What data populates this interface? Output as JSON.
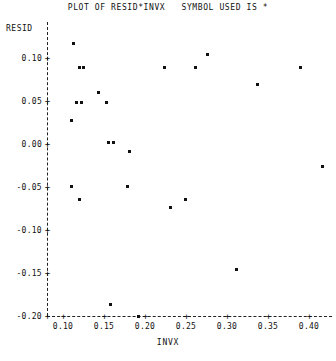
{
  "header": {
    "title": "PLOT OF RESID*INVX",
    "symbol_note": "SYMBOL USED IS *",
    "title_full": "PLOT OF RESID*INVX   SYMBOL USED IS *"
  },
  "chart_data": {
    "type": "scatter",
    "title": "PLOT OF RESID*INVX   SYMBOL USED IS *",
    "xlabel": "INVX",
    "ylabel": "RESID",
    "symbol": "*",
    "grid": false,
    "legend": "none",
    "xlim": [
      0.085,
      0.425
    ],
    "ylim": [
      -0.215,
      0.125
    ],
    "xticks": [
      0.1,
      0.15,
      0.2,
      0.25,
      0.3,
      0.35,
      0.4
    ],
    "xtick_labels": [
      "0.10",
      "0.15",
      "0.20",
      "0.25",
      "0.30",
      "0.35",
      "0.40"
    ],
    "yticks": [
      0.1,
      0.05,
      0.0,
      -0.05,
      -0.1,
      -0.15,
      -0.2
    ],
    "ytick_labels": [
      "0.10",
      "0.05",
      "0.00",
      "-0.05",
      "-0.10",
      "-0.15",
      "-0.20"
    ],
    "points": [
      {
        "x": 0.112,
        "y": 0.118
      },
      {
        "x": 0.276,
        "y": 0.105
      },
      {
        "x": 0.12,
        "y": 0.09
      },
      {
        "x": 0.124,
        "y": 0.09
      },
      {
        "x": 0.223,
        "y": 0.09
      },
      {
        "x": 0.261,
        "y": 0.089
      },
      {
        "x": 0.389,
        "y": 0.089
      },
      {
        "x": 0.337,
        "y": 0.07
      },
      {
        "x": 0.143,
        "y": 0.061
      },
      {
        "x": 0.116,
        "y": 0.049
      },
      {
        "x": 0.122,
        "y": 0.049
      },
      {
        "x": 0.152,
        "y": 0.049
      },
      {
        "x": 0.11,
        "y": 0.028
      },
      {
        "x": 0.155,
        "y": 0.002
      },
      {
        "x": 0.161,
        "y": 0.002
      },
      {
        "x": 0.18,
        "y": -0.008
      },
      {
        "x": 0.416,
        "y": -0.026
      },
      {
        "x": 0.11,
        "y": -0.049
      },
      {
        "x": 0.178,
        "y": -0.049
      },
      {
        "x": 0.119,
        "y": -0.064
      },
      {
        "x": 0.249,
        "y": -0.064
      },
      {
        "x": 0.23,
        "y": -0.073
      },
      {
        "x": 0.311,
        "y": -0.145
      },
      {
        "x": 0.157,
        "y": -0.186
      },
      {
        "x": 0.192,
        "y": -0.2
      }
    ]
  }
}
